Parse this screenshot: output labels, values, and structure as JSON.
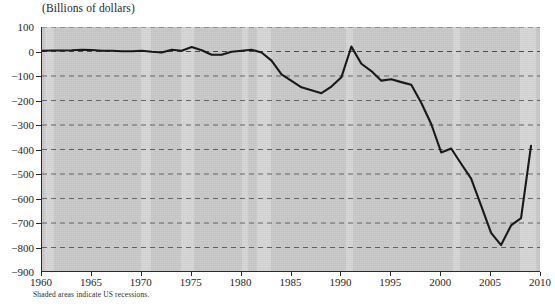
{
  "figure": {
    "axis_title": "(Billions of dollars)",
    "footnote": "Shaded areas indicate US recessions.",
    "background_color": "#c9c9c9",
    "recession_band_color": "#d6d6d6",
    "line_color": "#111111",
    "gridline_color": "#555555"
  },
  "chart_data": {
    "type": "line",
    "title": "(Billions of dollars)",
    "xlabel": "",
    "ylabel": "(Billions of dollars)",
    "xlim": [
      1960,
      2010
    ],
    "ylim": [
      -900,
      100
    ],
    "grid": true,
    "grid_style": "dashed-horizontal",
    "legend": "none",
    "annotations": [
      "Shaded areas indicate US recessions."
    ],
    "xticks": [
      1960,
      1965,
      1970,
      1975,
      1980,
      1985,
      1990,
      1995,
      2000,
      2005,
      2010
    ],
    "xtick_labels": [
      "1960",
      "1965",
      "1970",
      "1975",
      "1980",
      "1985",
      "1990",
      "1995",
      "2000",
      "2005",
      "2010"
    ],
    "yticks": [
      100,
      0,
      -100,
      -200,
      -300,
      -400,
      -500,
      -600,
      -700,
      -800,
      -900
    ],
    "ytick_labels": [
      "100",
      "0",
      "-100",
      "-200",
      "-300",
      "-400",
      "-500",
      "-600",
      "-700",
      "-800",
      "-900"
    ],
    "series": [
      {
        "name": "Balance",
        "color": "#111111",
        "x": [
          1960,
          1961,
          1962,
          1963,
          1964,
          1965,
          1966,
          1967,
          1968,
          1969,
          1970,
          1971,
          1972,
          1973,
          1974,
          1975,
          1976,
          1977,
          1978,
          1979,
          1980,
          1981,
          1982,
          1983,
          1984,
          1985,
          1986,
          1987,
          1988,
          1989,
          1990,
          1991,
          1992,
          1993,
          1994,
          1995,
          1996,
          1997,
          1998,
          1999,
          2000,
          2001,
          2002,
          2003,
          2004,
          2005,
          2006,
          2007,
          2008,
          2009
        ],
        "y": [
          3,
          4,
          4,
          5,
          7,
          6,
          3,
          3,
          1,
          1,
          3,
          -1,
          -4,
          7,
          3,
          18,
          5,
          -13,
          -13,
          -1,
          3,
          7,
          -4,
          -37,
          -93,
          -120,
          -146,
          -158,
          -170,
          -143,
          -105,
          20,
          -50,
          -80,
          -119,
          -113,
          -125,
          -136,
          -209,
          -296,
          -412,
          -396,
          -458,
          -519,
          -629,
          -740,
          -790,
          -710,
          -680,
          -385
        ],
        "units": "Billions of dollars"
      }
    ],
    "shaded_regions": [
      {
        "label": "US recession",
        "start": 1960.3,
        "end": 1961.2
      },
      {
        "label": "US recession",
        "start": 1969.9,
        "end": 1970.9
      },
      {
        "label": "US recession",
        "start": 1973.9,
        "end": 1975.2
      },
      {
        "label": "US recession",
        "start": 1980.0,
        "end": 1980.6
      },
      {
        "label": "US recession",
        "start": 1981.5,
        "end": 1982.9
      },
      {
        "label": "US recession",
        "start": 1990.5,
        "end": 1991.2
      },
      {
        "label": "US recession",
        "start": 2001.2,
        "end": 2001.9
      },
      {
        "label": "US recession",
        "start": 2007.9,
        "end": 2009.5
      }
    ]
  }
}
